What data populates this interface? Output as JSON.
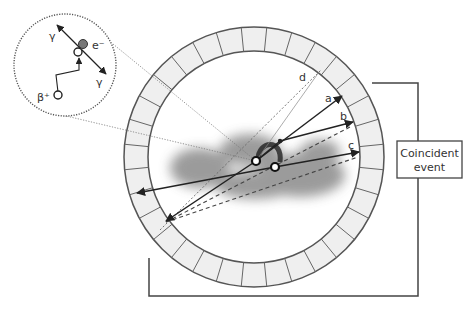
{
  "diagram": {
    "type": "PET annihilation and coincidence detection schematic",
    "detector_ring": {
      "center": [
        254,
        157
      ],
      "outer_radius": 130,
      "inner_radius": 106,
      "segments": 32,
      "fill": "#efefef",
      "stroke": "#555555"
    },
    "coincidence_box": {
      "line1": "Coincident",
      "line2": "event"
    },
    "lines": [
      {
        "id": "a",
        "label": "a",
        "style": "solid",
        "arrow_end": [
          342,
          96
        ]
      },
      {
        "id": "b",
        "label": "b",
        "style": "solid",
        "arrow_end": [
          353,
          122
        ]
      },
      {
        "id": "c",
        "label": "c",
        "style": "solid",
        "arrow_end": [
          359,
          152
        ]
      },
      {
        "id": "d",
        "label": "d",
        "style": "dotted",
        "end": [
          321,
          70
        ]
      }
    ],
    "inset": {
      "gamma_top": "γ",
      "gamma_bottom": "γ",
      "electron": "e⁻",
      "positron": "β⁺"
    },
    "colors": {
      "line": "#333333",
      "blob": "#8a8a8a",
      "ring_fill": "#efefef"
    }
  }
}
